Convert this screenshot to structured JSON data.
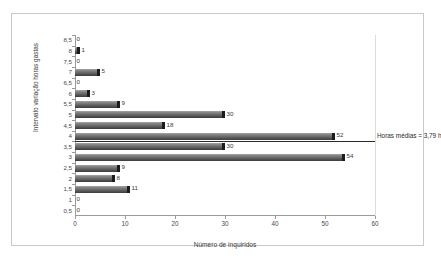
{
  "chart_data": {
    "type": "bar",
    "orientation": "horizontal",
    "title": "",
    "xlabel": "Número de inquiridos",
    "ylabel": "Intervalo variação horas gastas",
    "xlim": [
      0,
      60
    ],
    "xticks": [
      "0",
      "10",
      "20",
      "30",
      "40",
      "50",
      "60"
    ],
    "grid": false,
    "legend": null,
    "categories": [
      "8,5",
      "8",
      "7,5",
      "7",
      "6,5",
      "6",
      "5,5",
      "5",
      "4,5",
      "4",
      "3,5",
      "3",
      "2,5",
      "2",
      "1,5",
      "1",
      "0,5"
    ],
    "values": [
      0,
      1,
      0,
      5,
      0,
      3,
      9,
      30,
      18,
      52,
      30,
      54,
      9,
      8,
      11,
      0,
      0
    ],
    "data_labels": [
      "0",
      "1",
      "0",
      "5",
      "0",
      "3",
      "9",
      "30",
      "18",
      "52",
      "30",
      "54",
      "9",
      "8",
      "11",
      "0",
      "0"
    ],
    "annotations": [
      {
        "text": "Horas médias = 3,79 h",
        "value": 3.79,
        "type": "mean-line"
      }
    ],
    "colors": {
      "bar": "#707070",
      "bar_cap": "#1c1c1c",
      "axis": "#9a9a9a",
      "text": "#3a3a3a",
      "frame": "#c9c9c9",
      "background": "#ffffff",
      "mean_line": "#2b2b2b"
    }
  }
}
